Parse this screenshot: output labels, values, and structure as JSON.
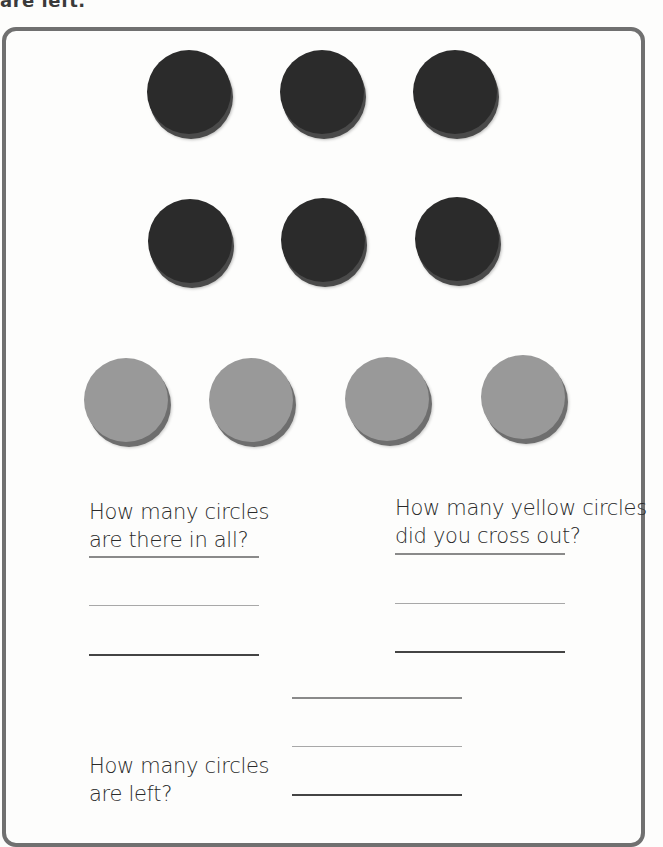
{
  "worksheet": {
    "cut_header_text": "are left.",
    "circles": {
      "dark_row_1": [
        {
          "x": 147,
          "y": 50
        },
        {
          "x": 280,
          "y": 50
        },
        {
          "x": 413,
          "y": 50
        }
      ],
      "dark_row_2": [
        {
          "x": 148,
          "y": 199
        },
        {
          "x": 281,
          "y": 198
        },
        {
          "x": 415,
          "y": 197
        }
      ],
      "yellow_row": [
        {
          "x": 84,
          "y": 358
        },
        {
          "x": 209,
          "y": 358
        },
        {
          "x": 345,
          "y": 357
        },
        {
          "x": 481,
          "y": 355
        }
      ],
      "dark_color": "#2b2b2b",
      "yellow_color": "#999999"
    },
    "questions": {
      "total": {
        "line1": "How many circles",
        "line2": "are there in all?"
      },
      "crossed_out": {
        "line1": "How many yellow circles",
        "line2": "did you cross out?"
      },
      "left": {
        "line1": "How many circles",
        "line2": "are left?"
      }
    },
    "border_color": "#707070"
  }
}
